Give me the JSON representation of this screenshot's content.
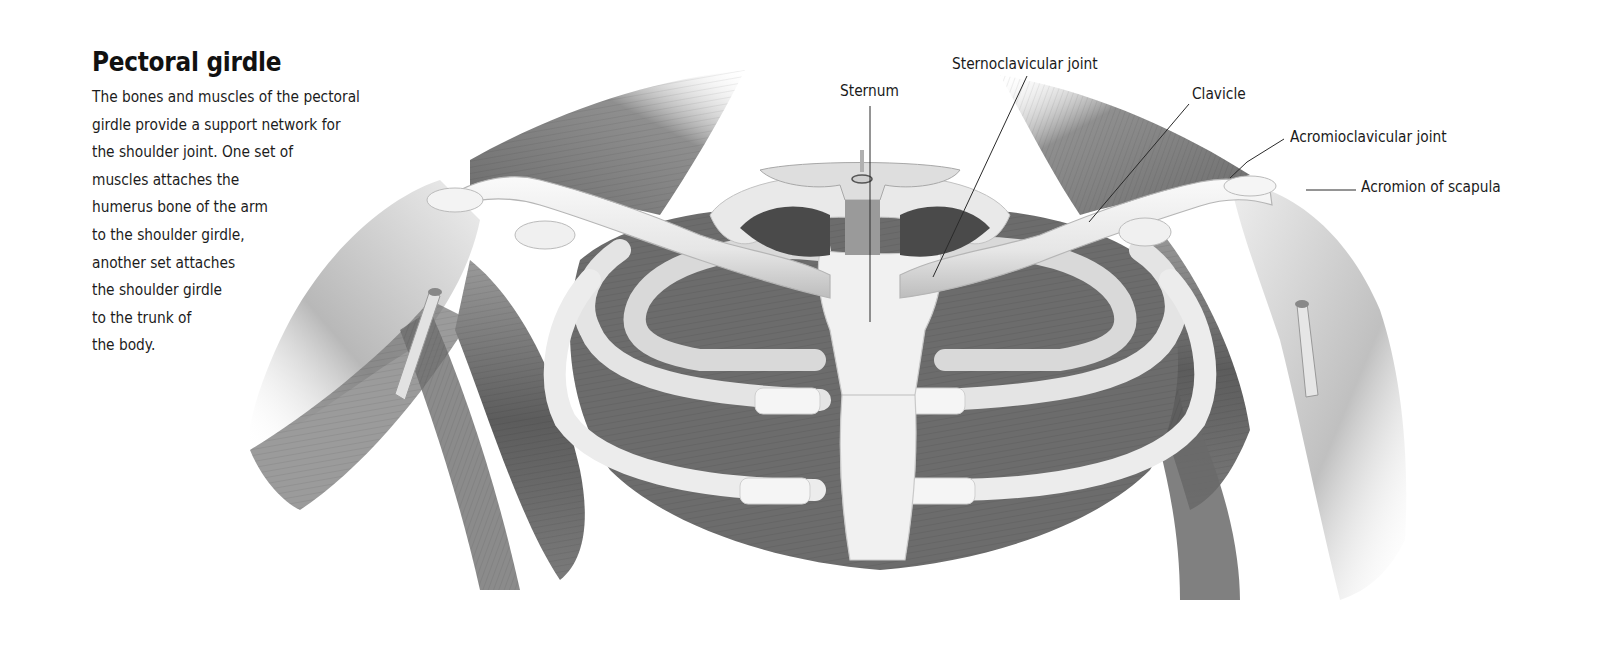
{
  "page": {
    "title": "Pectoral girdle",
    "body_lines": [
      "The bones and muscles of the pectoral",
      "girdle provide a support network for",
      "the shoulder joint. One set of",
      "muscles attaches the",
      "humerus bone of the arm",
      "to the shoulder girdle,",
      "another set attaches",
      "the shoulder girdle",
      "to the trunk of",
      "the body."
    ]
  },
  "illustration": {
    "subject": "Anterior view of pectoral girdle: clavicles, sternum, ribs, scapulae, shoulder muscles",
    "style": "grayscale anatomical drawing",
    "labels": [
      {
        "id": "sternum",
        "text": "Sternum"
      },
      {
        "id": "sternoclavicular-joint",
        "text": "Sternoclavicular joint"
      },
      {
        "id": "clavicle",
        "text": "Clavicle"
      },
      {
        "id": "acromioclavicular-joint",
        "text": "Acromioclavicular joint"
      },
      {
        "id": "acromion-of-scapula",
        "text": "Acromion of scapula"
      }
    ]
  },
  "colors": {
    "text": "#1a1a1a",
    "leader_line": "#2a2a2a",
    "bone": "#f2f2f2",
    "muscle_dark": "#5a5a5a",
    "muscle_mid": "#8a8a8a",
    "background": "#ffffff"
  }
}
